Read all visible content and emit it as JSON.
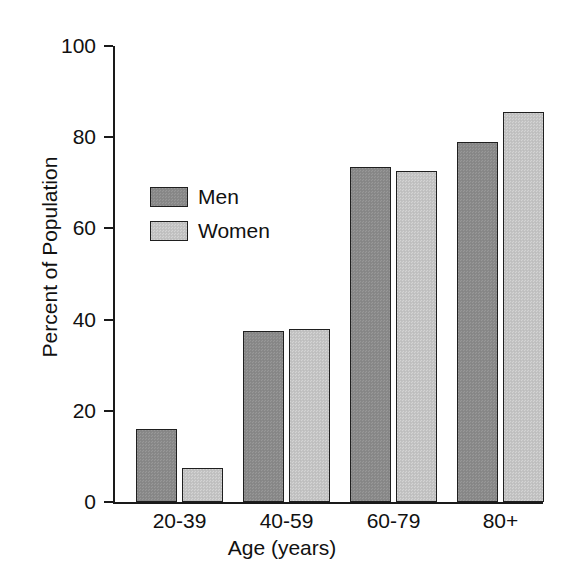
{
  "chart_data": {
    "type": "bar",
    "title": "",
    "xlabel": "Age (years)",
    "ylabel": "Percent of Population",
    "categories": [
      "20-39",
      "40-59",
      "60-79",
      "80+"
    ],
    "series": [
      {
        "name": "Men",
        "color": "#8a8a8a",
        "values": [
          16,
          37.5,
          73.5,
          79
        ]
      },
      {
        "name": "Women",
        "color": "#c4c4c4",
        "values": [
          7.5,
          38,
          72.5,
          85.5
        ]
      }
    ],
    "ylim": [
      0,
      100
    ],
    "yticks": [
      0,
      20,
      40,
      60,
      80,
      100
    ],
    "ytick_labels": [
      "0",
      "20",
      "40",
      "60",
      "80",
      "100"
    ],
    "grid": false,
    "legend_position": "upper-left-inside",
    "axis_color": "#1a1a1a",
    "background": "#ffffff"
  },
  "legend": {
    "entries": [
      {
        "label": "Men"
      },
      {
        "label": "Women"
      }
    ]
  }
}
